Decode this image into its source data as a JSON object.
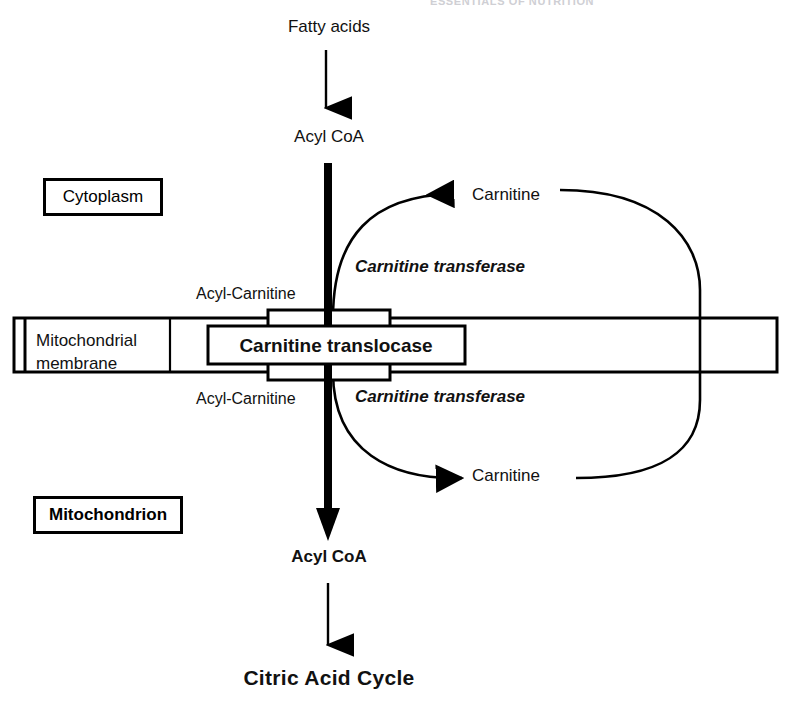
{
  "figure": {
    "page_header": "ESSENTIALS OF NUTRITION",
    "background_color": "#ffffff",
    "line_color": "#000000"
  },
  "compartments": {
    "cytoplasm_label": "Cytoplasm",
    "mitochondrion_label": "Mitochondrion",
    "membrane_label_line1": "Mitochondrial",
    "membrane_label_line2": "membrane",
    "membrane_label": "Mitochondrial membrane"
  },
  "metabolites": {
    "fatty_acids": "Fatty acids",
    "acyl_coa_cytoplasm": "Acyl CoA",
    "acyl_coa_matrix": "Acyl CoA",
    "acyl_carnitine_outer": "Acyl-Carnitine",
    "acyl_carnitine_inner": "Acyl-Carnitine",
    "carnitine_outer": "Carnitine",
    "carnitine_inner": "Carnitine",
    "citric_acid_cycle": "Citric Acid Cycle"
  },
  "enzymes": {
    "transferase_outer": "Carnitine  transferase",
    "transferase_inner": "Carnitine  transferase",
    "translocase": "Carnitine translocase"
  },
  "flow": {
    "steps": [
      "Fatty acids",
      "Acyl CoA",
      "Acyl-Carnitine",
      "Carnitine translocase",
      "Acyl-Carnitine",
      "Acyl CoA",
      "Citric Acid Cycle"
    ],
    "carnitine_cycle": [
      "Carnitine (cytoplasmic side)",
      "Carnitine (matrix side)"
    ]
  }
}
